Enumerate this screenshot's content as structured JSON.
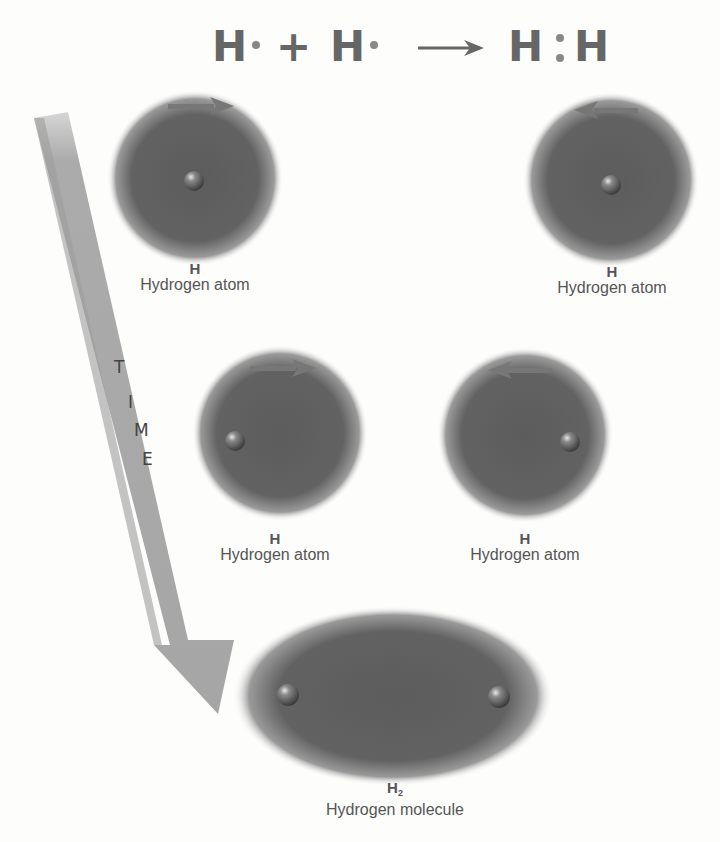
{
  "equation": {
    "reactant1": "H",
    "plus": "+",
    "reactant2": "H",
    "product_left": "H",
    "product_right": "H",
    "arrow": "reaction-arrow"
  },
  "time_arrow": {
    "letters": [
      "T",
      "I",
      "M",
      "E"
    ]
  },
  "atoms": [
    {
      "symbol": "H",
      "name": "Hydrogen atom",
      "direction": "right"
    },
    {
      "symbol": "H",
      "name": "Hydrogen atom",
      "direction": "left"
    },
    {
      "symbol": "H",
      "name": "Hydrogen atom",
      "direction": "right"
    },
    {
      "symbol": "H",
      "name": "Hydrogen atom",
      "direction": "left"
    }
  ],
  "molecule": {
    "symbol": "H",
    "subscript": "2",
    "name": "Hydrogen molecule"
  },
  "colors": {
    "cloud": "#5e5e5e",
    "arrow": "#a9a9a9",
    "nucleus": "#6f6f6f",
    "text": "#555555"
  }
}
